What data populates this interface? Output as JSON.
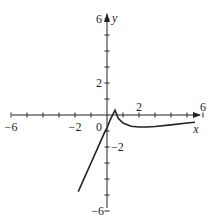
{
  "chart_data": {
    "type": "line",
    "title": "",
    "xlabel": "x",
    "ylabel": "y",
    "xlim": [
      -6.5,
      6.2
    ],
    "ylim": [
      -6.3,
      6.3
    ],
    "grid": false,
    "x_tick_labels": [
      "-6",
      "-2",
      "0",
      "2",
      "6"
    ],
    "y_tick_labels": [
      "6",
      "2",
      "-2",
      "-6"
    ],
    "series": [
      {
        "name": "f(x)",
        "x": [
          -1.8,
          -1.4,
          -1.0,
          -0.6,
          -0.2,
          0.0,
          0.2,
          0.5,
          0.7,
          1.0,
          1.5,
          2.0,
          2.5,
          3.0,
          4.0,
          5.0,
          5.5
        ],
        "y": [
          -4.8,
          -3.9,
          -3.0,
          -2.1,
          -1.2,
          -0.8,
          -0.3,
          0.3,
          -0.2,
          -0.5,
          -0.7,
          -0.75,
          -0.75,
          -0.72,
          -0.62,
          -0.5,
          -0.45
        ]
      }
    ]
  },
  "axes": {
    "origin_px": [
      107,
      115
    ],
    "unit_px": 16
  }
}
